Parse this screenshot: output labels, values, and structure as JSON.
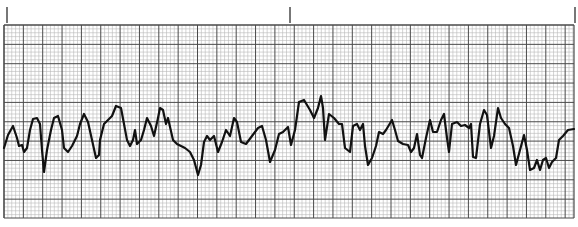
{
  "strip": {
    "description": "ECG rhythm strip on grid paper",
    "colors": {
      "background": "#ffffff",
      "minor_grid": "#b8b8b8",
      "major_grid": "#4a4a4a",
      "trace": "#111111",
      "time_marker": "#555555"
    },
    "grid": {
      "left": 4,
      "top": 25,
      "right": 574,
      "bottom": 218,
      "minor_spacing": 3.87,
      "minor_per_major": 5
    },
    "time_markers_x": [
      7,
      290,
      575
    ],
    "time_marker": {
      "top": 7,
      "bottom": 23
    },
    "trace_points": [
      [
        4,
        148
      ],
      [
        8,
        135
      ],
      [
        13,
        126
      ],
      [
        17,
        138
      ],
      [
        19,
        146
      ],
      [
        22,
        145
      ],
      [
        24,
        152
      ],
      [
        27,
        148
      ],
      [
        30,
        130
      ],
      [
        33,
        119
      ],
      [
        37,
        118
      ],
      [
        40,
        124
      ],
      [
        42,
        150
      ],
      [
        44,
        172
      ],
      [
        47,
        150
      ],
      [
        51,
        130
      ],
      [
        54,
        118
      ],
      [
        58,
        116
      ],
      [
        62,
        130
      ],
      [
        64,
        148
      ],
      [
        68,
        152
      ],
      [
        72,
        146
      ],
      [
        77,
        136
      ],
      [
        80,
        124
      ],
      [
        84,
        114
      ],
      [
        88,
        122
      ],
      [
        92,
        140
      ],
      [
        96,
        158
      ],
      [
        99,
        155
      ],
      [
        100,
        140
      ],
      [
        104,
        124
      ],
      [
        108,
        120
      ],
      [
        112,
        116
      ],
      [
        116,
        106
      ],
      [
        121,
        108
      ],
      [
        124,
        124
      ],
      [
        127,
        140
      ],
      [
        130,
        146
      ],
      [
        133,
        140
      ],
      [
        135,
        130
      ],
      [
        137,
        144
      ],
      [
        141,
        140
      ],
      [
        144,
        130
      ],
      [
        147,
        118
      ],
      [
        151,
        126
      ],
      [
        154,
        136
      ],
      [
        158,
        118
      ],
      [
        160,
        108
      ],
      [
        163,
        110
      ],
      [
        166,
        124
      ],
      [
        168,
        118
      ],
      [
        173,
        140
      ],
      [
        177,
        144
      ],
      [
        185,
        148
      ],
      [
        190,
        152
      ],
      [
        194,
        160
      ],
      [
        198,
        175
      ],
      [
        201,
        165
      ],
      [
        204,
        142
      ],
      [
        207,
        136
      ],
      [
        210,
        140
      ],
      [
        214,
        136
      ],
      [
        218,
        152
      ],
      [
        222,
        142
      ],
      [
        226,
        130
      ],
      [
        230,
        136
      ],
      [
        234,
        118
      ],
      [
        237,
        122
      ],
      [
        241,
        142
      ],
      [
        246,
        144
      ],
      [
        252,
        136
      ],
      [
        258,
        128
      ],
      [
        262,
        126
      ],
      [
        266,
        140
      ],
      [
        270,
        162
      ],
      [
        275,
        150
      ],
      [
        279,
        134
      ],
      [
        283,
        132
      ],
      [
        288,
        127
      ],
      [
        291,
        145
      ],
      [
        295,
        130
      ],
      [
        299,
        102
      ],
      [
        304,
        100
      ],
      [
        310,
        110
      ],
      [
        314,
        118
      ],
      [
        318,
        108
      ],
      [
        321,
        96
      ],
      [
        323,
        108
      ],
      [
        325,
        140
      ],
      [
        329,
        114
      ],
      [
        334,
        118
      ],
      [
        339,
        124
      ],
      [
        342,
        124
      ],
      [
        345,
        148
      ],
      [
        350,
        152
      ],
      [
        353,
        126
      ],
      [
        357,
        124
      ],
      [
        360,
        130
      ],
      [
        363,
        124
      ],
      [
        365,
        146
      ],
      [
        368,
        165
      ],
      [
        372,
        158
      ],
      [
        376,
        146
      ],
      [
        379,
        132
      ],
      [
        383,
        134
      ],
      [
        386,
        130
      ],
      [
        392,
        120
      ],
      [
        395,
        130
      ],
      [
        398,
        141
      ],
      [
        403,
        144
      ],
      [
        408,
        145
      ],
      [
        411,
        152
      ],
      [
        414,
        148
      ],
      [
        417,
        134
      ],
      [
        420,
        155
      ],
      [
        422,
        158
      ],
      [
        426,
        138
      ],
      [
        430,
        120
      ],
      [
        433,
        132
      ],
      [
        437,
        132
      ],
      [
        441,
        120
      ],
      [
        444,
        114
      ],
      [
        447,
        138
      ],
      [
        449,
        152
      ],
      [
        452,
        124
      ],
      [
        457,
        122
      ],
      [
        461,
        126
      ],
      [
        465,
        125
      ],
      [
        469,
        128
      ],
      [
        471,
        124
      ],
      [
        473,
        157
      ],
      [
        476,
        158
      ],
      [
        480,
        124
      ],
      [
        484,
        110
      ],
      [
        487,
        115
      ],
      [
        491,
        148
      ],
      [
        494,
        136
      ],
      [
        498,
        108
      ],
      [
        501,
        118
      ],
      [
        505,
        124
      ],
      [
        509,
        128
      ],
      [
        513,
        146
      ],
      [
        516,
        165
      ],
      [
        520,
        150
      ],
      [
        524,
        135
      ],
      [
        527,
        150
      ],
      [
        530,
        170
      ],
      [
        534,
        168
      ],
      [
        537,
        160
      ],
      [
        540,
        170
      ],
      [
        543,
        160
      ],
      [
        546,
        158
      ],
      [
        549,
        168
      ],
      [
        552,
        162
      ],
      [
        556,
        158
      ],
      [
        559,
        140
      ],
      [
        563,
        136
      ],
      [
        568,
        130
      ],
      [
        574,
        129
      ]
    ]
  }
}
